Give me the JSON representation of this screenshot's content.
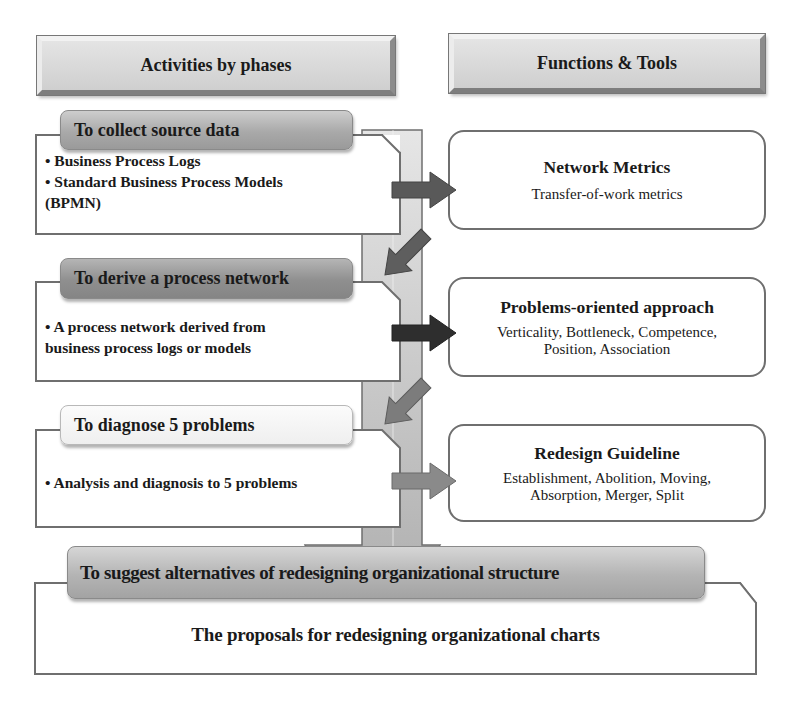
{
  "headers": {
    "left": "Activities by phases",
    "right": "Functions & Tools"
  },
  "phases": [
    {
      "title": "To collect source data",
      "lines": [
        "• Business Process Logs",
        "• Standard Business Process Models",
        "(BPMN)"
      ]
    },
    {
      "title": "To derive a process network",
      "lines": [
        "• A process network derived from",
        "business process logs or models"
      ]
    },
    {
      "title": "To diagnose 5 problems",
      "lines": [
        "• Analysis and diagnosis to 5 problems"
      ]
    }
  ],
  "functions": [
    {
      "title": "Network Metrics",
      "lines": [
        "Transfer-of-work metrics"
      ]
    },
    {
      "title": "Problems-oriented approach",
      "lines": [
        "Verticality, Bottleneck, Competence,",
        "Position, Association"
      ]
    },
    {
      "title": "Redesign Guideline",
      "lines": [
        "Establishment, Abolition, Moving,",
        "Absorption, Merger, Split"
      ]
    }
  ],
  "final": {
    "title": "To suggest alternatives of redesigning organizational structure",
    "content": "The proposals for redesigning organizational charts"
  },
  "colors": {
    "arrow_1": "#595959",
    "arrow_2": "#2e2e2e",
    "arrow_3": "#8a8a8a",
    "diag_arrow_1": "#5e5e5e",
    "diag_arrow_2": "#7c7c7c",
    "diag_arrow_3": "#9a9a9a",
    "band": "#c9c9c9",
    "border": "#6f6f6f"
  }
}
